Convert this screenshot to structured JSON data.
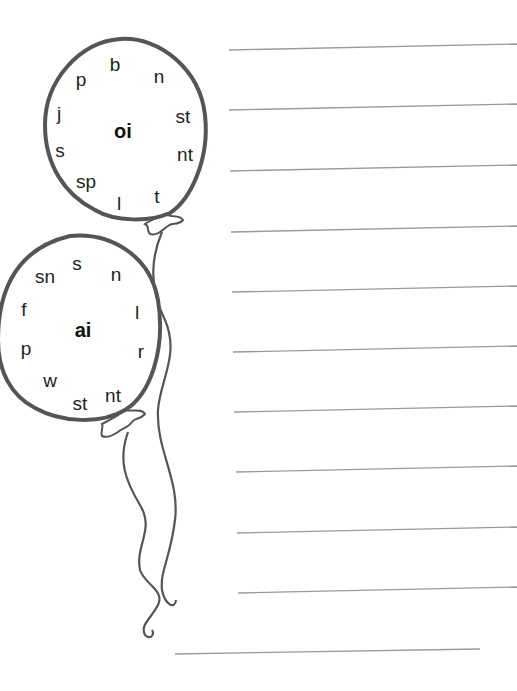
{
  "worksheet": {
    "balloons": [
      {
        "id": "oi",
        "center_label": "oi",
        "center": [
          123,
          131
        ],
        "letters": [
          {
            "text": "b",
            "x": 115,
            "y": 64
          },
          {
            "text": "n",
            "x": 159,
            "y": 76
          },
          {
            "text": "p",
            "x": 81,
            "y": 79
          },
          {
            "text": "j",
            "x": 59,
            "y": 113
          },
          {
            "text": "st",
            "x": 183,
            "y": 116
          },
          {
            "text": "s",
            "x": 60,
            "y": 150
          },
          {
            "text": "nt",
            "x": 185,
            "y": 154
          },
          {
            "text": "sp",
            "x": 86,
            "y": 181
          },
          {
            "text": "t",
            "x": 157,
            "y": 196
          },
          {
            "text": "l",
            "x": 119,
            "y": 203
          }
        ]
      },
      {
        "id": "ai",
        "center_label": "ai",
        "center": [
          83,
          330
        ],
        "letters": [
          {
            "text": "s",
            "x": 77,
            "y": 263
          },
          {
            "text": "sn",
            "x": 45,
            "y": 276
          },
          {
            "text": "n",
            "x": 116,
            "y": 274
          },
          {
            "text": "f",
            "x": 24,
            "y": 309
          },
          {
            "text": "l",
            "x": 137,
            "y": 312
          },
          {
            "text": "p",
            "x": 26,
            "y": 348
          },
          {
            "text": "r",
            "x": 141,
            "y": 351
          },
          {
            "text": "w",
            "x": 50,
            "y": 380
          },
          {
            "text": "nt",
            "x": 113,
            "y": 395
          },
          {
            "text": "st",
            "x": 80,
            "y": 403
          }
        ]
      }
    ],
    "answer_lines": [
      {
        "x1": 229,
        "y1": 50,
        "x2": 517,
        "y2": 44
      },
      {
        "x1": 229,
        "y1": 110,
        "x2": 517,
        "y2": 104
      },
      {
        "x1": 230,
        "y1": 171,
        "x2": 517,
        "y2": 165
      },
      {
        "x1": 231,
        "y1": 232,
        "x2": 517,
        "y2": 226
      },
      {
        "x1": 232,
        "y1": 292,
        "x2": 517,
        "y2": 286
      },
      {
        "x1": 233,
        "y1": 352,
        "x2": 517,
        "y2": 346
      },
      {
        "x1": 234,
        "y1": 412,
        "x2": 517,
        "y2": 406
      },
      {
        "x1": 236,
        "y1": 472,
        "x2": 517,
        "y2": 466
      },
      {
        "x1": 237,
        "y1": 533,
        "x2": 517,
        "y2": 527
      },
      {
        "x1": 238,
        "y1": 593,
        "x2": 517,
        "y2": 587
      },
      {
        "x1": 175,
        "y1": 654,
        "x2": 480,
        "y2": 649
      }
    ],
    "colors": {
      "outline": "#555555",
      "line": "#9a9a9a",
      "text": "#222222"
    }
  }
}
